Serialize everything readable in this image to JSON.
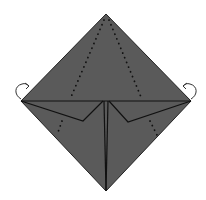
{
  "diagram": {
    "type": "origami-fold-step",
    "description": "Diamond-oriented folded paper with two side flaps folded down to the center line, dotted valley-fold lines, and curved arrows at left and right corners indicating folding behind.",
    "colors": {
      "paper": "#5a5a5a",
      "line": "#111111",
      "dots": "#111111",
      "arrow": "#333333",
      "background": "#ffffff"
    },
    "shape": {
      "top": [
        106,
        14
      ],
      "left": [
        21,
        101
      ],
      "right": [
        191,
        101
      ],
      "bottom": [
        106,
        191
      ]
    },
    "annotations": {
      "left_arrow": "curved-fold-behind-arrow",
      "right_arrow": "curved-fold-behind-arrow",
      "dotted_lines": [
        "upper-left valley fold",
        "upper-right valley fold",
        "lower-left valley fold",
        "lower-right valley fold"
      ]
    }
  }
}
